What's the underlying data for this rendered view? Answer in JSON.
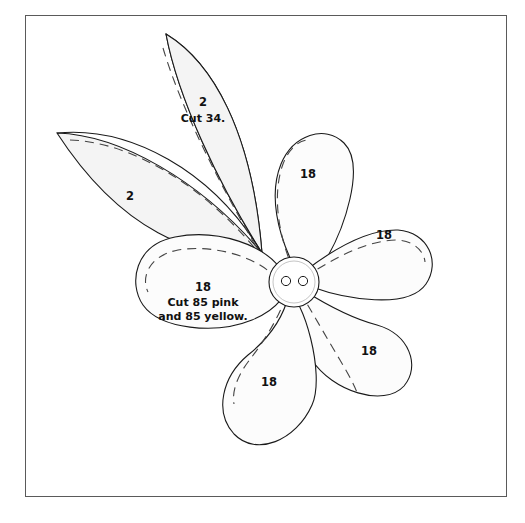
{
  "document": {
    "kind": "sewing-pattern-template-diagram",
    "frame": {
      "border_color": "#5a5a5a",
      "background": "#ffffff"
    }
  },
  "colors": {
    "outline": "#1a1a1a",
    "leaf_fill": "#f4f4f4",
    "petal_fill": "#fcfcfc",
    "button_fill": "#ffffff",
    "dashed": "#444444",
    "text": "#111111",
    "frame_border": "#5a5a5a"
  },
  "pieces": {
    "leaves": [
      {
        "id": "leaf-upper",
        "number": "2",
        "instruction": "Cut 34.",
        "label_x": 203,
        "label_y": 106,
        "instruction_x": 203,
        "instruction_y": 122
      },
      {
        "id": "leaf-left",
        "number": "2",
        "instruction": "",
        "label_x": 130,
        "label_y": 197,
        "instruction_x": 0,
        "instruction_y": 0
      }
    ],
    "petals": [
      {
        "id": "petal-top",
        "number": "18",
        "instruction": "",
        "label_x": 307,
        "label_y": 175
      },
      {
        "id": "petal-right",
        "number": "18",
        "instruction": "",
        "label_x": 382,
        "label_y": 235
      },
      {
        "id": "petal-bottom-right",
        "number": "18",
        "instruction": "",
        "label_x": 368,
        "label_y": 352
      },
      {
        "id": "petal-bottom",
        "number": "18",
        "instruction": "",
        "label_x": 268,
        "label_y": 382
      },
      {
        "id": "petal-left",
        "number": "18",
        "instruction_line_1": "Cut 85 pink",
        "instruction_line_2": "and 85 yellow.",
        "label_x": 202,
        "label_y": 287,
        "instruction_x": 202,
        "instruction_y": 303
      }
    ],
    "button": {
      "id": "center-button",
      "holes": 2,
      "cx": 294,
      "cy": 282,
      "r": 25,
      "inner_r": 21,
      "hole_r": 4.6,
      "hole1_cx": 286,
      "hole2_cx": 303,
      "hole_cy": 281
    }
  },
  "labels": {
    "leaf_number": "2",
    "leaf_instruction": "Cut 34.",
    "petal_number": "18",
    "petal_instruction_line_1": "Cut 85 pink",
    "petal_instruction_line_2": "and 85 yellow."
  }
}
